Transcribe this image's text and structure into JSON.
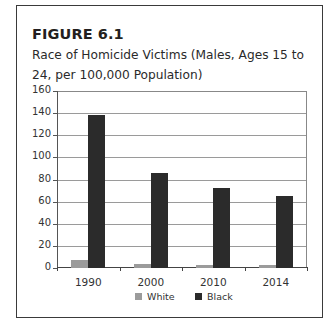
{
  "figure": {
    "label": "FIGURE 6.1",
    "title": "Race of Homicide Victims (Males, Ages 15 to 24, per 100,000 Population)"
  },
  "colors": {
    "white_series": "#9b9b9b",
    "black_series": "#2b2b2b",
    "gridline": "#9a9a9a",
    "border": "#3a3a3a"
  },
  "y_ticks": [
    "0",
    "20",
    "40",
    "60",
    "80",
    "100",
    "120",
    "140",
    "160"
  ],
  "x_labels": [
    "1990",
    "2000",
    "2010",
    "2014"
  ],
  "legend": [
    {
      "label": "White"
    },
    {
      "label": "Black"
    }
  ],
  "chart_data": {
    "type": "bar",
    "title": "Race of Homicide Victims (Males, Ages 15 to 24, per 100,000 Population)",
    "figure_label": "FIGURE 6.1",
    "categories": [
      "1990",
      "2000",
      "2010",
      "2014"
    ],
    "series": [
      {
        "name": "White",
        "values": [
          7,
          4,
          3,
          2.5
        ]
      },
      {
        "name": "Black",
        "values": [
          138,
          86,
          72,
          65
        ]
      }
    ],
    "xlabel": "",
    "ylabel": "",
    "ylim": [
      0,
      160
    ],
    "yticks": [
      0,
      20,
      40,
      60,
      80,
      100,
      120,
      140,
      160
    ],
    "grid": true,
    "legend_position": "bottom"
  }
}
